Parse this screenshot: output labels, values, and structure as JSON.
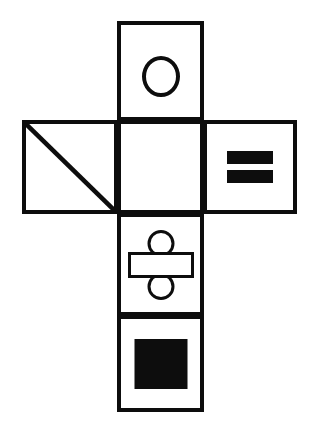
{
  "diagram": {
    "type": "cube-net",
    "background_color": "#ffffff",
    "stroke_color": "#0d0d0d",
    "fill_color": "#0d0d0d",
    "layout": "cross / T arrangement, 3 faces stacked in the middle column plus one face left and one face right of the second row",
    "faces": [
      {
        "id": "face-top",
        "position": "column 2, row 1",
        "symbol": "hollow-circle-icon",
        "symbol_label": "circle outline"
      },
      {
        "id": "face-left",
        "position": "column 1, row 2",
        "symbol": "diagonal-line-icon",
        "symbol_label": "diagonal line from top-left corner to bottom-right corner"
      },
      {
        "id": "face-center",
        "position": "column 2, row 2",
        "symbol": "blank-icon",
        "symbol_label": "empty face"
      },
      {
        "id": "face-right",
        "position": "column 3, row 2",
        "symbol": "equals-sign-icon",
        "symbol_label": "two solid horizontal bars (equals sign)"
      },
      {
        "id": "face-lower",
        "position": "column 2, row 3",
        "symbol": "division-sign-icon",
        "symbol_label": "hollow bar between two hollow circles (division sign)"
      },
      {
        "id": "face-bottom",
        "position": "column 2, row 4",
        "symbol": "filled-square-icon",
        "symbol_label": "solid black square"
      }
    ]
  }
}
